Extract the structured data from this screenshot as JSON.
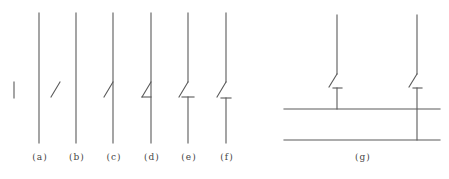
{
  "figure": {
    "stroke_color": "#5a5a5a",
    "panels": [
      {
        "id": "a",
        "label": "(a)",
        "label_x": 40
      },
      {
        "id": "b",
        "label": "(b)",
        "label_x": 77
      },
      {
        "id": "c",
        "label": "(c)",
        "label_x": 114
      },
      {
        "id": "d",
        "label": "(d)",
        "label_x": 152
      },
      {
        "id": "e",
        "label": "(e)",
        "label_x": 189
      },
      {
        "id": "f",
        "label": "(f)",
        "label_x": 227
      },
      {
        "id": "g",
        "label": "(g)",
        "label_x": 363
      }
    ]
  }
}
